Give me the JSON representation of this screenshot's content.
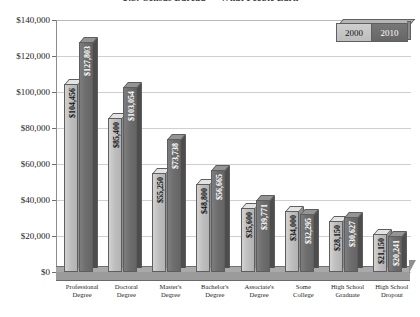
{
  "chart_data": {
    "type": "bar",
    "title": "U.S. Census Bureau — What People Earn",
    "xlabel": "",
    "ylabel": "",
    "ylim": [
      0,
      140000
    ],
    "ytick_labels": [
      "$140,000",
      "$120,000",
      "$100,000",
      "$80,000",
      "$60,000",
      "$40,000",
      "$20,000",
      "$0"
    ],
    "ytick_values": [
      140000,
      120000,
      100000,
      80000,
      60000,
      40000,
      20000,
      0
    ],
    "grid": true,
    "legend_position": "top-right",
    "style": "3d-clustered-column",
    "categories": [
      "Professional Degree",
      "Doctoral Degree",
      "Master's Degree",
      "Bachelor's Degree",
      "Associate's Degree",
      "Some College",
      "High School Graduate",
      "High School Dropout"
    ],
    "category_lines": [
      [
        "Professional",
        "Degree"
      ],
      [
        "Doctoral",
        "Degree"
      ],
      [
        "Master's",
        "Degree"
      ],
      [
        "Bachelor's",
        "Degree"
      ],
      [
        "Associate's",
        "Degree"
      ],
      [
        "Some",
        "College"
      ],
      [
        "High School",
        "Graduate"
      ],
      [
        "High School",
        "Dropout"
      ]
    ],
    "series": [
      {
        "name": "2000",
        "color": "#bfbfbf",
        "values": [
          104456,
          85400,
          55250,
          48800,
          35600,
          34000,
          28150,
          21150
        ],
        "labels": [
          "$104,456",
          "$85,400",
          "$55,250",
          "$48,800",
          "$35,600",
          "$34,000",
          "$28,150",
          "$21,150"
        ]
      },
      {
        "name": "2010",
        "color": "#6e6e6e",
        "values": [
          127803,
          103054,
          73738,
          56665,
          39771,
          32295,
          30627,
          20241
        ],
        "labels": [
          "$127,803",
          "$103,054",
          "$73,738",
          "$56,665",
          "$39,771",
          "$32,295",
          "$30,627",
          "$20,241"
        ]
      }
    ]
  },
  "legend": {
    "items": [
      {
        "label": "2000"
      },
      {
        "label": "2010"
      }
    ]
  }
}
